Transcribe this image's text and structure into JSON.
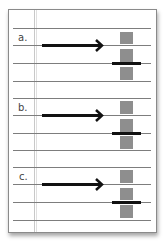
{
  "sections": [
    {
      "label": "a.",
      "top": 0
    },
    {
      "label": "b.",
      "top": 70
    },
    {
      "label": "c.",
      "top": 140
    }
  ],
  "colors": {
    "rule": "#7d7d7d",
    "bar": "#8e8e8e",
    "arrow": "#111111"
  }
}
